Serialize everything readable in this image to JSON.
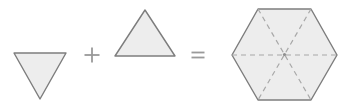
{
  "figure": {
    "canvas": {
      "width": 345,
      "height": 109
    },
    "background_color": "#ffffff"
  },
  "style": {
    "shape_fill": "#ededed",
    "shape_stroke": "#7d7d7d",
    "shape_stroke_width": 1.4,
    "dash_stroke": "#a8a8a8",
    "dash_stroke_width": 1.2,
    "dash_pattern": "5,4",
    "operator_color": "#9a9a9a"
  },
  "operators": [
    {
      "name": "plus",
      "symbol": "+",
      "label": "plus-sign",
      "x": 92,
      "y": 55,
      "arm": 7.5,
      "thickness": 1.8
    },
    {
      "name": "equals",
      "symbol": "=",
      "label": "equals-sign",
      "x": 198,
      "y": 55,
      "arm": 6.5,
      "thickness": 1.8,
      "gap": 4
    }
  ],
  "shapes": [
    {
      "name": "downward-triangle",
      "type": "triangle",
      "orientation": "down",
      "points": "14,53 66,53 40,99",
      "side_length": 52,
      "vertices": [
        {
          "label": "top-left",
          "x": 14,
          "y": 53
        },
        {
          "label": "top-right",
          "x": 66,
          "y": 53
        },
        {
          "label": "bottom",
          "x": 40,
          "y": 99
        }
      ]
    },
    {
      "name": "upward-triangle",
      "type": "triangle",
      "orientation": "up",
      "points": "145,10 175,56 115,56",
      "side_length": 60,
      "vertices": [
        {
          "label": "apex",
          "x": 145,
          "y": 10
        },
        {
          "label": "bottom-right",
          "x": 175,
          "y": 56
        },
        {
          "label": "bottom-left",
          "x": 115,
          "y": 56
        }
      ]
    },
    {
      "name": "hexagon",
      "type": "hexagon",
      "orientation": "flat-top",
      "points": "258,9 311,9 337,55 311,100 258,100 232,55",
      "center": {
        "x": 284.5,
        "y": 54.5
      },
      "side_length": 53,
      "vertices": [
        {
          "label": "top-left",
          "x": 258,
          "y": 9
        },
        {
          "label": "top-right",
          "x": 311,
          "y": 9
        },
        {
          "label": "right",
          "x": 337,
          "y": 55
        },
        {
          "label": "bottom-right",
          "x": 311,
          "y": 100
        },
        {
          "label": "bottom-left",
          "x": 258,
          "y": 100
        },
        {
          "label": "left",
          "x": 232,
          "y": 55
        }
      ],
      "diagonals": [
        {
          "label": "horizontal-diagonal",
          "x1": 232,
          "y1": 55,
          "x2": 337,
          "y2": 55
        },
        {
          "label": "top-left-to-bottom-right-diagonal",
          "x1": 258,
          "y1": 9,
          "x2": 311,
          "y2": 100
        },
        {
          "label": "top-right-to-bottom-left-diagonal",
          "x1": 311,
          "y1": 9,
          "x2": 258,
          "y2": 100
        }
      ],
      "center_marker": {
        "label": "center-point",
        "x": 284.5,
        "y": 54.5,
        "radius": 1.6
      }
    }
  ]
}
